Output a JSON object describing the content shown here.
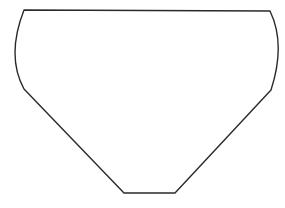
{
  "figure": {
    "stroke_color": "#2a2a2a",
    "fill_color": "#ffffff",
    "background": "#ffffff",
    "points": {
      "top_left": [
        24,
        10
      ],
      "top_right": [
        270,
        11
      ],
      "left_curve_control": [
        8,
        45
      ],
      "left_shoulder": [
        24,
        89
      ],
      "right_curve_control": [
        286,
        55
      ],
      "right_shoulder": [
        271,
        90
      ],
      "bottom_left": [
        124,
        193
      ],
      "bottom_right": [
        175,
        193
      ]
    }
  }
}
